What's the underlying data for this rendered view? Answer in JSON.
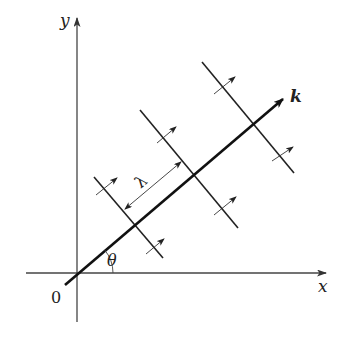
{
  "figure": {
    "labels": {
      "y_axis": "y",
      "x_axis": "x",
      "origin": "0",
      "angle": "θ",
      "wave_vector": "k",
      "wavelength": "λ"
    },
    "colors": {
      "axis": "#444444",
      "k_vector": "#111111",
      "wavefront": "#222222",
      "small_arrow": "#333333",
      "background": "#ffffff"
    },
    "geometry": {
      "origin": [
        77,
        273
      ],
      "y_axis": {
        "from": [
          77,
          322
        ],
        "to": [
          77,
          18
        ]
      },
      "x_axis": {
        "from": [
          26,
          273
        ],
        "to": [
          326,
          273
        ]
      },
      "k_vector": {
        "from": [
          65,
          285
        ],
        "to": [
          283,
          99
        ]
      },
      "wavefronts": [
        {
          "from": [
            94,
            177
          ],
          "to": [
            163,
            258
          ]
        },
        {
          "from": [
            140,
            110
          ],
          "to": [
            238,
            228
          ]
        },
        {
          "from": [
            202,
            62
          ],
          "to": [
            294,
            173
          ]
        }
      ],
      "propagation_arrows": [
        {
          "from": [
            96,
            195
          ],
          "to": [
            117,
            178
          ]
        },
        {
          "from": [
            146,
            254
          ],
          "to": [
            164,
            239
          ]
        },
        {
          "from": [
            157,
            143
          ],
          "to": [
            176,
            127
          ]
        },
        {
          "from": [
            214,
            215
          ],
          "to": [
            236,
            197
          ]
        },
        {
          "from": [
            214,
            94
          ],
          "to": [
            235,
            77
          ]
        },
        {
          "from": [
            272,
            161
          ],
          "to": [
            293,
            147
          ]
        }
      ],
      "wavelength_marker": {
        "from": [
          125,
          209
        ],
        "to": [
          181,
          162
        ]
      },
      "angle_arc": {
        "radius": 36,
        "start_deg": 0,
        "end_deg": 40
      }
    }
  }
}
